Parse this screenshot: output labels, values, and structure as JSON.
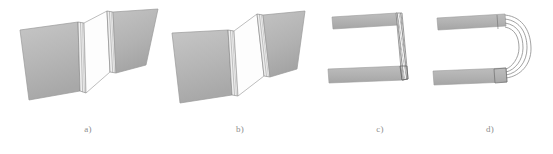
{
  "figure": {
    "width": 553,
    "height": 154,
    "background_color": "#ffffff",
    "type": "technical-line-drawing",
    "colors": {
      "plate_fill": "#b4b4b4",
      "plate_fill_light": "#c3c3c3",
      "plate_fill_dark": "#a6a6a6",
      "hinge_fill": "#ffffff",
      "outline": "#8a8a8a",
      "outline_dark": "#6e6e6e",
      "hatch_line": "#7a7a7a",
      "caption_text": "#8d8d8d"
    }
  },
  "panels": [
    {
      "id": "a",
      "caption": "a)",
      "view": "perspective",
      "description": "Two flat gray plates angled apart, joined by an open white quadrilateral hinge panel; thin striped band along each plate edge",
      "plate_count": 2,
      "hinge_state": "open-wide"
    },
    {
      "id": "b",
      "caption": "b)",
      "view": "perspective",
      "description": "Same two plates rotated further, the white hinge quadrilateral is narrower and skewed",
      "plate_count": 2,
      "hinge_state": "partially-closed"
    },
    {
      "id": "c",
      "caption": "c)",
      "view": "side-elevation",
      "description": "Two parallel horizontal bars joined at the right end by a narrow vertical cross-hatched strip forming a square U",
      "plate_count": 2,
      "hinge_state": "straight-fold"
    },
    {
      "id": "d",
      "caption": "d)",
      "view": "side-elevation",
      "description": "Two parallel horizontal bars joined at the right end by several nested curved arc lines forming a rounded U bend",
      "plate_count": 2,
      "hinge_state": "curved-fold",
      "arc_count": 4
    }
  ]
}
